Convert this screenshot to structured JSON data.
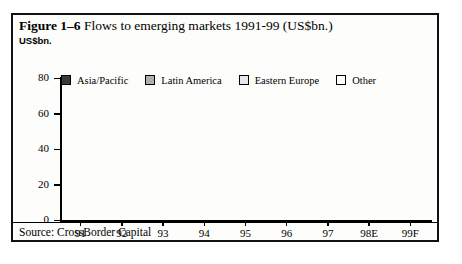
{
  "figure": {
    "number": "Figure 1–6",
    "title": "Flows to emerging markets 1991-99 (US$bn.)",
    "axis_unit": "US$bn.",
    "source": "Source: CrossBorder Capital"
  },
  "colors": {
    "asia_pacific": "#3a3a3a",
    "latin_america": "#b0b0b0",
    "eastern_europe": "#e8e8e8",
    "other": "#ffffff",
    "outline": "#000000",
    "background": "#fdfdfb"
  },
  "chart_data": {
    "type": "bar",
    "stacked": true,
    "title": "Flows to emerging markets 1991-99 (US$bn.)",
    "xlabel": "",
    "ylabel": "US$bn.",
    "ylim": [
      0,
      80
    ],
    "yticks": [
      0,
      20,
      40,
      60,
      80
    ],
    "grid": false,
    "legend_position": "top",
    "categories": [
      "91",
      "92",
      "93",
      "94",
      "95",
      "96",
      "97",
      "98E",
      "99F"
    ],
    "series": [
      {
        "name": "Asia/Pacific",
        "values": [
          6,
          11,
          40,
          22,
          16,
          28,
          17,
          22,
          24
        ]
      },
      {
        "name": "Latin America",
        "values": [
          8,
          8,
          22,
          14,
          8,
          14,
          11,
          12,
          13
        ]
      },
      {
        "name": "Eastern Europe",
        "values": [
          1,
          1,
          2,
          2,
          2,
          3,
          3,
          4,
          4
        ]
      },
      {
        "name": "Other",
        "values": [
          1,
          1,
          2,
          8,
          5,
          4,
          4,
          5,
          6
        ]
      }
    ],
    "totals": [
      16,
      21,
      66,
      46,
      31,
      49,
      35,
      43,
      47
    ]
  },
  "legend": {
    "entries": [
      {
        "label": "Asia/Pacific",
        "swatch": "dark"
      },
      {
        "label": "Latin America",
        "swatch": "mid"
      },
      {
        "label": "Eastern Europe",
        "swatch": "light"
      },
      {
        "label": "Other",
        "swatch": "white"
      }
    ]
  }
}
